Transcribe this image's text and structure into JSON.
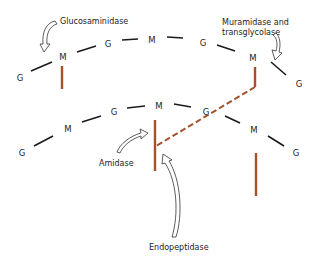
{
  "diagram": {
    "top_strand": [
      "G",
      "M",
      "G",
      "M",
      "G",
      "M",
      "G"
    ],
    "bottom_strand": [
      "G",
      "M",
      "G",
      "M",
      "G",
      "M",
      "G"
    ],
    "labels": {
      "glucosaminidase": "Glucosaminidase",
      "muramidase_line1": "Muramidase and",
      "muramidase_line2": "transglycolase",
      "amidase": "Amidase",
      "endopeptidase": "Endopeptidase"
    },
    "colors": {
      "glycan_bond": "#1a1a1a",
      "peptide": "#a4512c"
    }
  }
}
